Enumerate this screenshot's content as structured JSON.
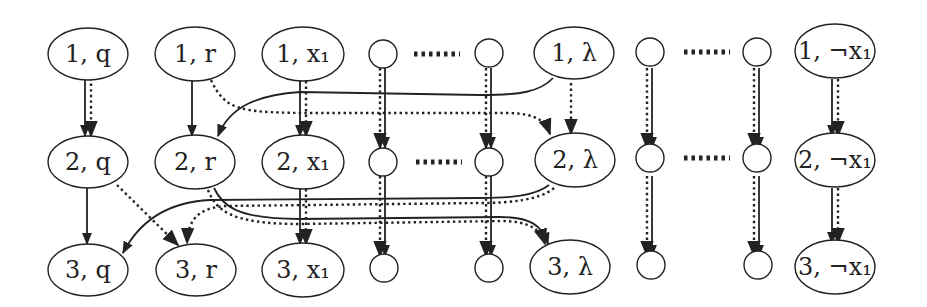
{
  "diagram": {
    "title": "",
    "rows": [
      1,
      2,
      3
    ],
    "columns": [
      {
        "id": "q",
        "x": 88,
        "kind": "ellipse",
        "labels": [
          "1, q",
          "2, q",
          "3, q"
        ]
      },
      {
        "id": "r",
        "x": 195,
        "kind": "ellipse",
        "labels": [
          "1, r",
          "2, r",
          "3, r"
        ]
      },
      {
        "id": "x1",
        "x": 303,
        "kind": "ellipse",
        "labels": [
          "1, x₁",
          "2, x₁",
          "3, x₁"
        ]
      },
      {
        "id": "c1",
        "x": 383,
        "kind": "circle",
        "labels": [
          "",
          "",
          ""
        ]
      },
      {
        "id": "c2",
        "x": 489,
        "kind": "circle",
        "labels": [
          "",
          "",
          ""
        ]
      },
      {
        "id": "lambda",
        "x": 574,
        "kind": "ellipse",
        "labels": [
          "1, λ",
          "2, λ",
          "3, λ"
        ]
      },
      {
        "id": "c3",
        "x": 650,
        "kind": "circle",
        "labels": [
          "",
          "",
          ""
        ]
      },
      {
        "id": "c4",
        "x": 757,
        "kind": "circle",
        "labels": [
          "",
          "",
          ""
        ]
      },
      {
        "id": "notx1",
        "x": 835,
        "kind": "ellipse",
        "labels": [
          "1, ¬x₁",
          "2, ¬x₁",
          "3, ¬x₁"
        ]
      }
    ],
    "row_y": [
      54,
      162,
      270
    ],
    "ellipsis_label": "·····",
    "edge_styles": {
      "solid": "solid arrow",
      "dotted": "dotted arrow"
    },
    "edges": [
      {
        "from": "1,q",
        "to": "2,q",
        "style": "solid+dotted"
      },
      {
        "from": "2,q",
        "to": "3,q",
        "style": "solid"
      },
      {
        "from": "2,q",
        "to": "3,r",
        "style": "dotted"
      },
      {
        "from": "1,r",
        "to": "2,r",
        "style": "solid"
      },
      {
        "from": "1,r",
        "to": "2,λ",
        "style": "dotted"
      },
      {
        "from": "1,λ",
        "to": "2,r",
        "style": "solid"
      },
      {
        "from": "1,λ",
        "to": "2,λ",
        "style": "dotted"
      },
      {
        "from": "2,λ",
        "to": "3,q",
        "style": "solid"
      },
      {
        "from": "2,λ",
        "to": "3,r",
        "style": "dotted"
      },
      {
        "from": "2,r",
        "to": "3,λ",
        "style": "solid+dotted"
      },
      {
        "from": "1,x₁",
        "to": "2,x₁",
        "style": "solid+dotted"
      },
      {
        "from": "2,x₁",
        "to": "3,x₁",
        "style": "solid+dotted"
      },
      {
        "from": "circles",
        "to": "circles",
        "style": "solid+dotted"
      },
      {
        "from": "1,¬x₁",
        "to": "2,¬x₁",
        "style": "solid+dotted"
      },
      {
        "from": "2,¬x₁",
        "to": "3,¬x₁",
        "style": "solid+dotted"
      }
    ],
    "colors": {
      "stroke": "#222222",
      "background": "#ffffff"
    }
  }
}
